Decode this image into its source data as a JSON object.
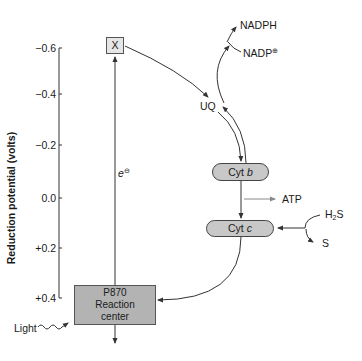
{
  "axis": {
    "label": "Reduction potential (volts)",
    "ticks": [
      "−0.6",
      "−0.4",
      "−0.2",
      "0.0",
      "+0.2",
      "+0.4"
    ]
  },
  "nodes": {
    "x": "X",
    "reaction_center": [
      "P870",
      "Reaction",
      "center"
    ],
    "cyt_b": {
      "prefix": "Cyt ",
      "suffix": "b"
    },
    "cyt_c": {
      "prefix": "Cyt ",
      "suffix": "c"
    },
    "uq": "UQ"
  },
  "labels": {
    "nadph": "NADPH",
    "nadp": "NADP",
    "nadp_charge": "⊕",
    "electron": "e",
    "electron_charge": "⊖",
    "atp": "ATP",
    "h2s_h": "H",
    "h2s_sub": "2",
    "h2s_s": "S",
    "s": "S",
    "light": "Light"
  },
  "colors": {
    "box_x_fill": "#e6e6e6",
    "reaction_center_fill": "#b3b3b3",
    "cyt_fill": "#c8c8c8",
    "line": "#333333",
    "atp_arrow": "#888888"
  }
}
